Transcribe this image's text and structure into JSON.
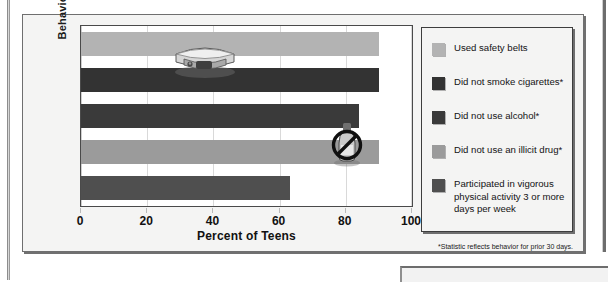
{
  "chart_data": {
    "type": "bar",
    "orientation": "horizontal",
    "title": "",
    "xlabel": "Percent of Teens",
    "ylabel": "Behaviors",
    "xlim": [
      0,
      100
    ],
    "xticks": [
      0,
      20,
      40,
      60,
      80,
      100
    ],
    "grid": true,
    "legend_position": "right",
    "categories": [
      "Used safety belts",
      "Did not smoke cigarettes*",
      "Did not use alcohol*",
      "Did not use an illicit drug*",
      "Participated in vigorous physical activity 3 or more days per week"
    ],
    "values": [
      90,
      90,
      84,
      90,
      63
    ],
    "colors": [
      "#b3b3b3",
      "#333333",
      "#3a3a3a",
      "#9b9b9b",
      "#4f4f4f"
    ],
    "footnote": "*Statistic reflects behavior for prior 30 days.",
    "annotations": [
      {
        "name": "seat-belt-buckle-photo",
        "on_bar": 0
      },
      {
        "name": "no-alcohol-symbol-photo",
        "on_bar": 2
      }
    ]
  },
  "axes": {
    "y_title": "Behaviors",
    "x_title": "Percent of Teens",
    "x_tick_labels": [
      "0",
      "20",
      "40",
      "60",
      "80",
      "100"
    ]
  },
  "legend": {
    "items": [
      {
        "label": "Used safety belts",
        "color": "#b3b3b3"
      },
      {
        "label": "Did not smoke cigarettes*",
        "color": "#333333"
      },
      {
        "label": "Did not use alcohol*",
        "color": "#3a3a3a"
      },
      {
        "label": "Did not use an illicit drug*",
        "color": "#9b9b9b"
      },
      {
        "label": "Participated in vigorous physical activity 3 or more days per week",
        "color": "#4f4f4f"
      }
    ]
  },
  "footnote": "*Statistic reflects behavior for prior 30 days."
}
